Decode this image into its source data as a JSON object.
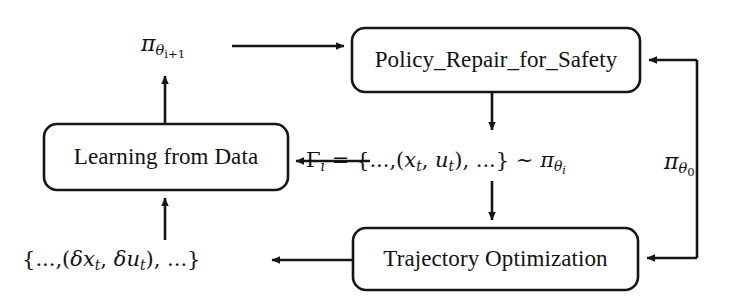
{
  "figure": {
    "background_color": "#ffffff",
    "stroke_color": "#161616"
  },
  "boxes": [
    {
      "id": "policy-repair",
      "label": "Policy_Repair_for_Safety",
      "x": 352,
      "y": 28,
      "width": 288,
      "height": 64
    },
    {
      "id": "learning-from-data",
      "label": "Learning from Data",
      "x": 44,
      "y": 124,
      "width": 244,
      "height": 66
    },
    {
      "id": "trajectory-optimization",
      "label": "Trajectory Optimization",
      "x": 353,
      "y": 228,
      "width": 285,
      "height": 62
    }
  ],
  "math_labels": {
    "policy_next": {
      "plain": "π_{θ_{i+1}}",
      "pi": "π",
      "theta": "θ",
      "index": "i+1"
    },
    "policy_init": {
      "plain": "π_{θ_0}",
      "pi": "π",
      "theta": "θ",
      "index": "0"
    },
    "trajectory_set": {
      "plain": "Γ_i = {..., (x_t, u_t), ...} ~ π_{θ_i}",
      "gamma": "Γ",
      "gamma_sub": "i",
      "equals": "=",
      "open_brace": "{",
      "lead_ellipsis": "...,",
      "open_paren": "(",
      "state": "x",
      "state_sub": "t",
      "comma": ",",
      "control": "u",
      "control_sub": "t",
      "close_paren": ")",
      "trail_ellipsis": ", ...",
      "close_brace": "}",
      "tilde": "~",
      "pi": "π",
      "theta": "θ",
      "theta_sub": "i"
    },
    "delta_set": {
      "plain": "{..., (δx_t, δu_t), ...}",
      "open_brace": "{",
      "lead_ellipsis": "...,",
      "open_paren": "(",
      "delta": "δ",
      "state": "x",
      "state_sub": "t",
      "comma": ",",
      "delta2": "δ",
      "control": "u",
      "control_sub": "t",
      "close_paren": ")",
      "trail_ellipsis": ", ...",
      "close_brace": "}"
    }
  },
  "edges": [
    {
      "id": "learning-to-policy-next",
      "from": "learning-from-data",
      "to": "policy-repair",
      "via_label": "policy_next",
      "description": "upward then rightward arrow carrying updated policy"
    },
    {
      "id": "policy-to-trajectory",
      "from": "policy-repair",
      "to": "trajectory-optimization",
      "via_label": "trajectory_set",
      "description": "downward arrow passing rollout trajectory set"
    },
    {
      "id": "trajectory-set-to-learning",
      "from": "trajectory_set",
      "to": "learning-from-data",
      "description": "leftward arrow feeding trajectories into learning"
    },
    {
      "id": "trajectory-to-delta-set",
      "from": "trajectory-optimization",
      "to": "delta_set",
      "description": "leftward arrow emitting state/control deviations"
    },
    {
      "id": "delta-set-to-learning",
      "from": "delta_set",
      "to": "learning-from-data",
      "description": "upward arrow feeding deviations into learning"
    },
    {
      "id": "init-policy-to-policy-repair",
      "from": "policy_init",
      "to": "policy-repair",
      "description": "initial policy branch entering repair box from the right"
    },
    {
      "id": "init-policy-to-trajectory",
      "from": "policy_init",
      "to": "trajectory-optimization",
      "description": "initial policy branch entering trajectory optimization from the right"
    }
  ]
}
